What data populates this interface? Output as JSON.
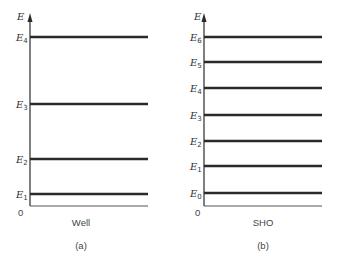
{
  "panels": [
    {
      "id": "a",
      "axis_label": "E",
      "origin_label": "0",
      "xlabel": "Well",
      "caption": "(a)",
      "levels": [
        {
          "name": "E",
          "sub": "4",
          "y": 37
        },
        {
          "name": "E",
          "sub": "3",
          "y": 104
        },
        {
          "name": "E",
          "sub": "2",
          "y": 159
        },
        {
          "name": "E",
          "sub": "1",
          "y": 194
        }
      ]
    },
    {
      "id": "b",
      "axis_label": "E",
      "origin_label": "0",
      "xlabel": "SHO",
      "caption": "(b)",
      "levels": [
        {
          "name": "E",
          "sub": "6",
          "y": 37
        },
        {
          "name": "E",
          "sub": "5",
          "y": 62
        },
        {
          "name": "E",
          "sub": "4",
          "y": 88
        },
        {
          "name": "E",
          "sub": "3",
          "y": 115
        },
        {
          "name": "E",
          "sub": "2",
          "y": 141
        },
        {
          "name": "E",
          "sub": "1",
          "y": 166
        },
        {
          "name": "E",
          "sub": "0",
          "y": 193
        }
      ]
    }
  ]
}
